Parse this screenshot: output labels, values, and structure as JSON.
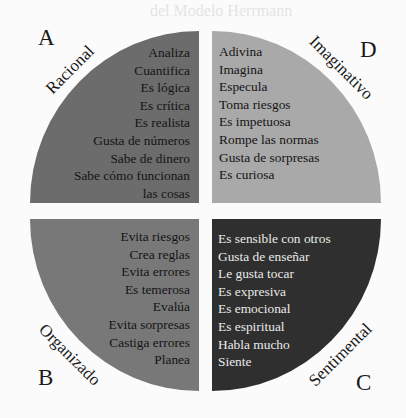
{
  "background_ghost_text": "del Modelo Herrmann",
  "quadrants": {
    "A": {
      "letter": "A",
      "name": "Racional",
      "color": "#6c6c6c",
      "items": [
        "Analiza",
        "Cuantifica",
        "Es lógica",
        "Es crítica",
        "Es realista",
        "Gusta de números",
        "Sabe de dinero",
        "Sabe cómo funcionan",
        "las cosas"
      ]
    },
    "D": {
      "letter": "D",
      "name": "Imaginativo",
      "color": "#a9a9a9",
      "items": [
        "Adivina",
        "Imagina",
        "Especula",
        "Toma riesgos",
        "Es impetuosa",
        "Rompe las normas",
        "Gusta de sorpresas",
        "Es curiosa"
      ]
    },
    "B": {
      "letter": "B",
      "name": "Organizado",
      "color": "#787878",
      "items": [
        "Evita riesgos",
        "Crea reglas",
        "Evita errores",
        "Es temerosa",
        "Evalúa",
        "Evita sorpresas",
        "Castiga errores",
        "Planea"
      ]
    },
    "C": {
      "letter": "C",
      "name": "Sentimental",
      "color": "#2f2f2f",
      "items": [
        "Es sensible con otros",
        "Gusta de enseñar",
        "Le gusta tocar",
        "Es expresiva",
        "Es emocional",
        "Es espiritual",
        "Habla mucho",
        "Siente"
      ]
    }
  }
}
